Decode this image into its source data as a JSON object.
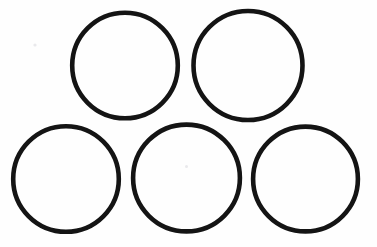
{
  "canvas": {
    "width": 377,
    "height": 247,
    "background_color": "#fefefe",
    "description": "Five black outlined circles arranged in two rows"
  },
  "style": {
    "stroke_color": "#141414",
    "stroke_width": 4.6,
    "fill": "none",
    "speck_color": "#e9e9ec"
  },
  "figure": {
    "title": "five-circles-arrangement",
    "rows": [
      {
        "name": "top-row",
        "count": 2
      },
      {
        "name": "bottom-row",
        "count": 3
      }
    ],
    "shapes": [
      {
        "id": "circle-top-left",
        "label": "Circle 1",
        "row": "top-row",
        "cx": 125,
        "cy": 65.5,
        "r": 52.8,
        "stroke": "#141414",
        "stroke_width": 4.6
      },
      {
        "id": "circle-top-right",
        "label": "Circle 2",
        "row": "top-row",
        "cx": 248,
        "cy": 65.5,
        "r": 54.5,
        "stroke": "#141414",
        "stroke_width": 4.6
      },
      {
        "id": "circle-bottom-left",
        "label": "Circle 3",
        "row": "bottom-row",
        "cx": 66,
        "cy": 179,
        "r": 52.8,
        "stroke": "#141414",
        "stroke_width": 4.6
      },
      {
        "id": "circle-bottom-middle",
        "label": "Circle 4",
        "row": "bottom-row",
        "cx": 186.5,
        "cy": 178,
        "r": 53.4,
        "stroke": "#141414",
        "stroke_width": 4.6
      },
      {
        "id": "circle-bottom-right",
        "label": "Circle 5",
        "row": "bottom-row",
        "cx": 305.5,
        "cy": 179,
        "r": 52.4,
        "stroke": "#141414",
        "stroke_width": 4.6
      }
    ],
    "specks": [
      {
        "id": "speck-center-bottom-middle",
        "cx": 186.5,
        "cy": 166.5,
        "r": 1.5,
        "color": "#e4e4e8"
      },
      {
        "id": "speck-stray-upper-left",
        "cx": 35,
        "cy": 45,
        "r": 1.6,
        "color": "#f3f3f5"
      }
    ]
  }
}
